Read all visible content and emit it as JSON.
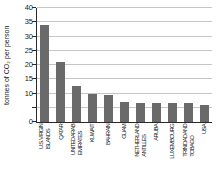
{
  "chart_data": {
    "type": "bar",
    "title": "",
    "xlabel": "",
    "ylabel": "tonnes of CO₂ per person",
    "ylim": [
      0,
      40
    ],
    "grid": "on",
    "grid_step": 5,
    "ytick_labels": [
      0,
      10,
      15,
      20,
      25,
      30,
      35,
      40
    ],
    "categories": [
      "U.S. VIRGIN\nISLANDS",
      "QATAR",
      "UNITED ARAB\nEMIRATES",
      "KUWAIT",
      "BAHRAIN",
      "GUAM",
      "NETHERLAND\nANTILLES",
      "ARUBA",
      "LUXEMBOURG",
      "TRINIDAD AND\nTOBAGO",
      "USA"
    ],
    "values": [
      34,
      21,
      12.5,
      10,
      9.5,
      7,
      6.7,
      6.5,
      6.7,
      6.5,
      6
    ],
    "bar_color": "#6a6a6a",
    "grid_color": "#c6c6c6",
    "axis_color": "#2a2a2a",
    "text_color": "#1a1a1a"
  }
}
